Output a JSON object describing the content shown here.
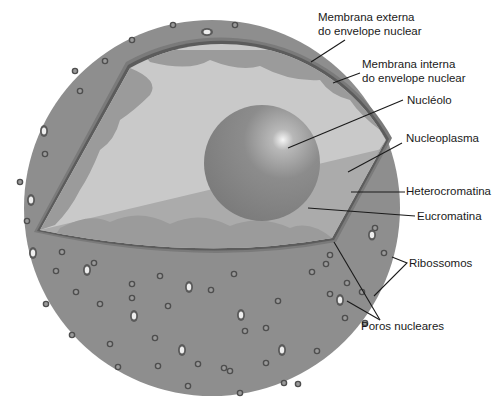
{
  "diagram": {
    "title": "",
    "colors": {
      "background": "#ffffff",
      "outer_sphere": "#8e8e8e",
      "outer_membrane": "#6a6a6a",
      "inner_membrane": "#5a5a5a",
      "nucleoplasm_light": "#c8c8c8",
      "nucleoplasm_shadow": "#a9a9a9",
      "heterochromatin": "#9a9a9a",
      "nucleolus": "#8a8a8a",
      "nucleolus_highlight": "#f4f4f4",
      "leader_line": "#1a1a1a",
      "label_text": "#1a1a1a"
    },
    "labels": [
      {
        "id": "outer-membrane",
        "line1": "Membrana externa",
        "line2": "do envelope nuclear"
      },
      {
        "id": "inner-membrane",
        "line1": "Membrana interna",
        "line2": "do envelope nuclear"
      },
      {
        "id": "nucleolus",
        "line1": "Nucléolo"
      },
      {
        "id": "nucleoplasm",
        "line1": "Nucleoplasma"
      },
      {
        "id": "heterochromatin",
        "line1": "Heterocromatina"
      },
      {
        "id": "euchromatin",
        "line1": "Eucromatina"
      },
      {
        "id": "ribosomes",
        "line1": "Ribossomos"
      },
      {
        "id": "nuclear-pores",
        "line1": "Poros nucleares"
      }
    ]
  }
}
